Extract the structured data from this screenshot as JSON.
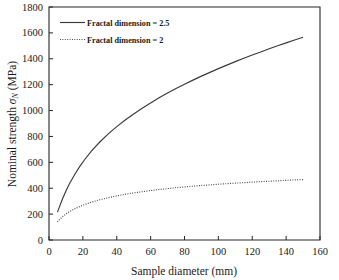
{
  "chart_data": {
    "type": "line",
    "title": "",
    "xlabel": "Sample diameter (mm)",
    "ylabel_prefix": "Nominal strength ",
    "ylabel_symbol": "σ",
    "ylabel_subscript": "N",
    "ylabel_suffix": " (MPa)",
    "ylabel_full": "Nominal strength σN (MPa)",
    "xlim": [
      0,
      160
    ],
    "ylim": [
      0,
      1800
    ],
    "xticks": [
      0,
      20,
      40,
      60,
      80,
      100,
      120,
      140,
      160
    ],
    "yticks": [
      0,
      200,
      400,
      600,
      800,
      1000,
      1200,
      1400,
      1600,
      1800
    ],
    "xtick_labels": [
      "0",
      "20",
      "40",
      "60",
      "80",
      "100",
      "120",
      "140",
      "160"
    ],
    "ytick_labels": [
      "0",
      "200",
      "400",
      "600",
      "800",
      "1000",
      "1200",
      "1400",
      "1600",
      "1800"
    ],
    "grid": false,
    "legend_position": "top-left",
    "series": [
      {
        "name": "Fractal dimension = 2.5",
        "style": "solid",
        "color": "#3a3a3a",
        "x": [
          5,
          6,
          8,
          10,
          12,
          15,
          18,
          21,
          25,
          30,
          35,
          40,
          45,
          50,
          55,
          60,
          65,
          70,
          75,
          80,
          85,
          90,
          95,
          100,
          105,
          110,
          115,
          120,
          125,
          130,
          135,
          140,
          145,
          150
        ],
        "y": [
          215,
          250,
          318,
          378,
          432,
          502,
          565,
          620,
          686,
          757,
          820,
          876,
          927,
          974,
          1018,
          1059,
          1098,
          1135,
          1170,
          1203,
          1235,
          1266,
          1295,
          1324,
          1351,
          1378,
          1404,
          1429,
          1453,
          1477,
          1500,
          1523,
          1545,
          1566
        ]
      },
      {
        "name": "Fractal dimension = 2",
        "style": "dotted",
        "color": "#3a3a3a",
        "x": [
          5,
          6,
          8,
          10,
          12,
          15,
          18,
          21,
          25,
          30,
          35,
          40,
          45,
          50,
          55,
          60,
          65,
          70,
          75,
          80,
          85,
          90,
          95,
          100,
          105,
          110,
          115,
          120,
          125,
          130,
          135,
          140,
          145,
          150
        ],
        "y": [
          140,
          155,
          180,
          200,
          218,
          240,
          258,
          274,
          292,
          311,
          327,
          341,
          353,
          364,
          373,
          382,
          390,
          397,
          404,
          410,
          416,
          421,
          426,
          431,
          435,
          439,
          443,
          447,
          451,
          454,
          457,
          461,
          464,
          467
        ]
      }
    ],
    "legend": [
      {
        "label": "Fractal dimension = 2.5",
        "style": "solid"
      },
      {
        "label": "Fractal dimension = 2",
        "style": "dotted"
      }
    ]
  }
}
